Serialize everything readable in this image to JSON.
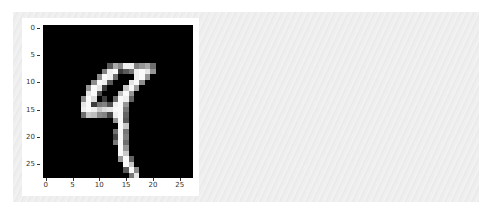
{
  "chart_data": {
    "type": "heatmap",
    "title": "",
    "xlabel": "",
    "ylabel": "",
    "colormap": "gray",
    "shape": [
      28,
      28
    ],
    "xlim": [
      -0.5,
      27.5
    ],
    "ylim": [
      27.5,
      -0.5
    ],
    "xticks": [
      0,
      5,
      10,
      15,
      20,
      25
    ],
    "yticks": [
      0,
      5,
      10,
      15,
      20,
      25
    ],
    "grid": false,
    "depicts": "handwritten digit 9",
    "nonzero_pixels": [
      [
        7,
        12,
        90
      ],
      [
        7,
        13,
        170
      ],
      [
        7,
        14,
        140
      ],
      [
        7,
        15,
        240
      ],
      [
        7,
        16,
        240
      ],
      [
        7,
        17,
        130
      ],
      [
        7,
        18,
        150
      ],
      [
        7,
        19,
        170
      ],
      [
        7,
        20,
        110
      ],
      [
        8,
        11,
        130
      ],
      [
        8,
        12,
        240
      ],
      [
        8,
        13,
        250
      ],
      [
        8,
        14,
        60
      ],
      [
        8,
        15,
        90
      ],
      [
        8,
        16,
        120
      ],
      [
        8,
        17,
        240
      ],
      [
        8,
        18,
        250
      ],
      [
        8,
        19,
        230
      ],
      [
        8,
        20,
        150
      ],
      [
        9,
        10,
        140
      ],
      [
        9,
        11,
        250
      ],
      [
        9,
        12,
        240
      ],
      [
        9,
        13,
        110
      ],
      [
        9,
        17,
        240
      ],
      [
        9,
        18,
        250
      ],
      [
        9,
        19,
        150
      ],
      [
        10,
        9,
        140
      ],
      [
        10,
        10,
        250
      ],
      [
        10,
        11,
        240
      ],
      [
        10,
        12,
        90
      ],
      [
        10,
        16,
        230
      ],
      [
        10,
        17,
        250
      ],
      [
        10,
        18,
        140
      ],
      [
        11,
        8,
        150
      ],
      [
        11,
        9,
        250
      ],
      [
        11,
        10,
        230
      ],
      [
        11,
        11,
        60
      ],
      [
        11,
        15,
        200
      ],
      [
        11,
        16,
        250
      ],
      [
        11,
        17,
        160
      ],
      [
        12,
        8,
        230
      ],
      [
        12,
        9,
        250
      ],
      [
        12,
        10,
        80
      ],
      [
        12,
        14,
        190
      ],
      [
        12,
        15,
        250
      ],
      [
        12,
        16,
        150
      ],
      [
        13,
        7,
        140
      ],
      [
        13,
        8,
        250
      ],
      [
        13,
        9,
        220
      ],
      [
        13,
        11,
        60
      ],
      [
        13,
        13,
        110
      ],
      [
        13,
        14,
        250
      ],
      [
        13,
        15,
        240
      ],
      [
        13,
        16,
        100
      ],
      [
        14,
        7,
        230
      ],
      [
        14,
        8,
        250
      ],
      [
        14,
        9,
        60
      ],
      [
        14,
        10,
        120
      ],
      [
        14,
        11,
        130
      ],
      [
        14,
        12,
        80
      ],
      [
        14,
        13,
        240
      ],
      [
        14,
        14,
        250
      ],
      [
        14,
        15,
        150
      ],
      [
        15,
        7,
        240
      ],
      [
        15,
        8,
        250
      ],
      [
        15,
        9,
        240
      ],
      [
        15,
        10,
        200
      ],
      [
        15,
        11,
        220
      ],
      [
        15,
        12,
        230
      ],
      [
        15,
        13,
        250
      ],
      [
        15,
        14,
        250
      ],
      [
        15,
        15,
        120
      ],
      [
        16,
        7,
        110
      ],
      [
        16,
        8,
        200
      ],
      [
        16,
        9,
        190
      ],
      [
        16,
        10,
        140
      ],
      [
        16,
        11,
        130
      ],
      [
        16,
        12,
        70
      ],
      [
        16,
        13,
        240
      ],
      [
        16,
        14,
        250
      ],
      [
        16,
        15,
        100
      ],
      [
        17,
        13,
        150
      ],
      [
        17,
        14,
        250
      ],
      [
        17,
        15,
        90
      ],
      [
        18,
        14,
        250
      ],
      [
        18,
        15,
        200
      ],
      [
        19,
        13,
        110
      ],
      [
        19,
        14,
        250
      ],
      [
        19,
        15,
        120
      ],
      [
        20,
        13,
        70
      ],
      [
        20,
        14,
        250
      ],
      [
        20,
        15,
        130
      ],
      [
        21,
        13,
        120
      ],
      [
        21,
        14,
        250
      ],
      [
        21,
        15,
        110
      ],
      [
        22,
        14,
        250
      ],
      [
        22,
        15,
        150
      ],
      [
        23,
        14,
        250
      ],
      [
        23,
        15,
        200
      ],
      [
        24,
        14,
        150
      ],
      [
        24,
        15,
        250
      ],
      [
        24,
        16,
        100
      ],
      [
        25,
        15,
        250
      ],
      [
        25,
        16,
        200
      ],
      [
        26,
        15,
        90
      ],
      [
        26,
        16,
        250
      ],
      [
        26,
        17,
        140
      ],
      [
        27,
        16,
        120
      ],
      [
        27,
        17,
        230
      ]
    ]
  },
  "axes": {
    "y_ticks": [
      "0",
      "5",
      "10",
      "15",
      "20",
      "25"
    ],
    "x_ticks": [
      "0",
      "5",
      "10",
      "15",
      "20",
      "25"
    ]
  }
}
